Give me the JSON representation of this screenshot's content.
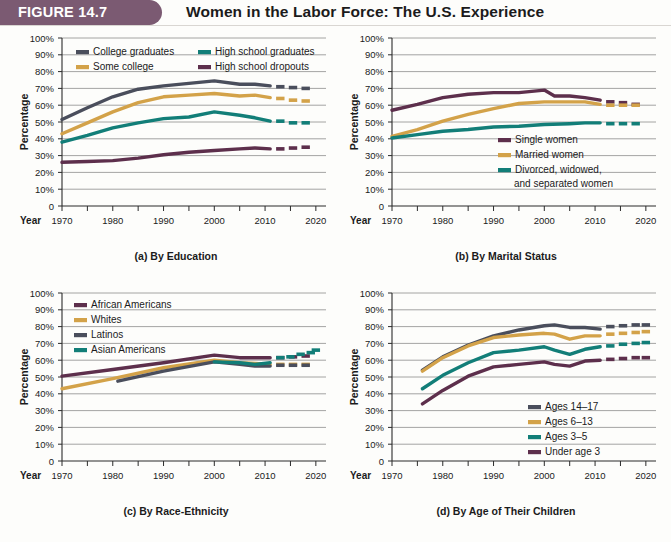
{
  "header": {
    "figure_tag": "FIGURE 14.7",
    "title": "Women in the Labor Force: The U.S. Experience",
    "tab_color": "#7b5a72"
  },
  "colors": {
    "slate": "#4a4e5c",
    "gold": "#d3a249",
    "teal": "#127e78",
    "plum": "#5d2f4c"
  },
  "axes": {
    "y_ticks": [
      "100%",
      "90%",
      "80%",
      "70%",
      "60%",
      "50%",
      "40%",
      "30%",
      "20%",
      "10%",
      "0"
    ],
    "x_ticks": [
      "1970",
      "1980",
      "1990",
      "2000",
      "2010",
      "2020"
    ],
    "x_label": "Year",
    "y_label": "Percentage"
  },
  "chart_data": [
    {
      "type": "line",
      "panel": "a",
      "title": "(a) By Education",
      "xlabel": "Year",
      "ylabel": "Percentage",
      "xlim": [
        1970,
        2022
      ],
      "ylim": [
        0,
        100
      ],
      "grid": true,
      "legend_position": "top-inside",
      "series": [
        {
          "name": "College graduates",
          "color": "#4a4e5c",
          "x": [
            1970,
            1975,
            1980,
            1985,
            1990,
            1995,
            2000,
            2005,
            2008,
            2011
          ],
          "values": [
            51.5,
            58.5,
            65.0,
            69.5,
            71.5,
            73.0,
            74.5,
            72.5,
            72.5,
            71.5
          ],
          "projection_x": [
            2013,
            2015.5,
            2018
          ],
          "projection_values": [
            71.0,
            70.5,
            70.0
          ]
        },
        {
          "name": "Some college",
          "color": "#d3a249",
          "x": [
            1970,
            1975,
            1980,
            1985,
            1990,
            1995,
            2000,
            2005,
            2008,
            2011
          ],
          "values": [
            43.0,
            49.5,
            56.0,
            61.5,
            65.0,
            66.0,
            67.0,
            65.5,
            66.0,
            64.5
          ],
          "projection_x": [
            2013,
            2015.5,
            2018
          ],
          "projection_values": [
            64.0,
            63.0,
            62.5
          ]
        },
        {
          "name": "High school graduates",
          "color": "#127e78",
          "x": [
            1970,
            1975,
            1980,
            1985,
            1990,
            1995,
            2000,
            2005,
            2008,
            2011
          ],
          "values": [
            38.0,
            42.0,
            46.5,
            49.5,
            52.0,
            53.0,
            56.0,
            54.0,
            52.5,
            50.5
          ],
          "projection_x": [
            2013,
            2015.5,
            2018
          ],
          "projection_values": [
            50.5,
            49.5,
            49.5
          ]
        },
        {
          "name": "High school dropouts",
          "color": "#5d2f4c",
          "x": [
            1970,
            1975,
            1980,
            1985,
            1990,
            1995,
            2000,
            2005,
            2008,
            2011
          ],
          "values": [
            26.0,
            26.5,
            27.0,
            28.5,
            30.5,
            32.0,
            33.0,
            34.0,
            34.5,
            34.0
          ],
          "projection_x": [
            2013,
            2015.5,
            2018
          ],
          "projection_values": [
            34.0,
            34.5,
            35.0
          ]
        }
      ]
    },
    {
      "type": "line",
      "panel": "b",
      "title": "(b) By Marital Status",
      "xlabel": "Year",
      "ylabel": "Percentage",
      "xlim": [
        1970,
        2022
      ],
      "ylim": [
        0,
        100
      ],
      "grid": true,
      "legend_position": "middle-right-inside",
      "series": [
        {
          "name": "Single women",
          "color": "#5d2f4c",
          "x": [
            1970,
            1975,
            1980,
            1985,
            1990,
            1995,
            2000,
            2002,
            2005,
            2008,
            2011
          ],
          "values": [
            57.0,
            60.5,
            64.5,
            66.5,
            67.5,
            67.5,
            69.0,
            65.5,
            65.5,
            64.5,
            63.0
          ],
          "projection_x": [
            2013,
            2015.5,
            2018
          ],
          "projection_values": [
            62.0,
            61.5,
            60.5
          ]
        },
        {
          "name": "Married women",
          "color": "#d3a249",
          "x": [
            1970,
            1975,
            1980,
            1985,
            1990,
            1995,
            2000,
            2005,
            2008,
            2011
          ],
          "values": [
            41.5,
            45.5,
            50.5,
            54.5,
            58.0,
            61.0,
            62.0,
            62.0,
            62.0,
            60.5
          ],
          "projection_x": [
            2013,
            2015.5,
            2018
          ],
          "projection_values": [
            60.0,
            60.0,
            60.0
          ]
        },
        {
          "name": "Divorced, widowed, and separated women",
          "color": "#127e78",
          "x": [
            1970,
            1975,
            1980,
            1985,
            1990,
            1995,
            2000,
            2005,
            2008,
            2011
          ],
          "values": [
            40.5,
            42.5,
            44.5,
            45.5,
            47.0,
            47.5,
            48.5,
            49.0,
            49.5,
            49.5
          ],
          "projection_x": [
            2013,
            2015.5,
            2018
          ],
          "projection_values": [
            49.0,
            49.0,
            49.0
          ]
        }
      ]
    },
    {
      "type": "line",
      "panel": "c",
      "title": "(c) By Race-Ethnicity",
      "xlabel": "Year",
      "ylabel": "Percentage",
      "xlim": [
        1970,
        2022
      ],
      "ylim": [
        0,
        100
      ],
      "grid": true,
      "legend_position": "top-left-inside",
      "series": [
        {
          "name": "African Americans",
          "color": "#5d2f4c",
          "x": [
            1970,
            1980,
            1990,
            2000,
            2005,
            2008,
            2011
          ],
          "values": [
            50.5,
            54.5,
            58.5,
            63.0,
            61.5,
            61.5,
            61.5
          ],
          "projection_x": [
            2013,
            2015.5,
            2018
          ],
          "projection_values": [
            61.5,
            62.0,
            62.5
          ]
        },
        {
          "name": "Whites",
          "color": "#d3a249",
          "x": [
            1970,
            1980,
            1990,
            2000,
            2005,
            2008,
            2011
          ],
          "values": [
            43.0,
            49.0,
            55.5,
            60.0,
            58.5,
            58.0,
            57.5
          ],
          "projection_x": [
            2013,
            2015.5,
            2018
          ],
          "projection_values": [
            57.5,
            57.5,
            57.5
          ]
        },
        {
          "name": "Latinos",
          "color": "#4a4e5c",
          "x": [
            1981,
            1990,
            2000,
            2005,
            2008,
            2011
          ],
          "values": [
            47.5,
            53.5,
            59.0,
            57.5,
            56.5,
            56.5
          ],
          "projection_x": [
            2013,
            2015.5,
            2018
          ],
          "projection_values": [
            57.0,
            57.0,
            57.0
          ]
        },
        {
          "name": "Asian Americans",
          "color": "#127e78",
          "x": [
            2000,
            2005,
            2008,
            2011
          ],
          "values": [
            59.0,
            58.5,
            57.5,
            58.5
          ],
          "projection_x": [
            2013,
            2015,
            2017,
            2019,
            2020
          ],
          "projection_values": [
            61.5,
            62.0,
            63.5,
            64.5,
            66.0
          ]
        }
      ]
    },
    {
      "type": "line",
      "panel": "d",
      "title": "(d) By Age of Their Children",
      "xlabel": "Year",
      "ylabel": "Percentage",
      "xlim": [
        1970,
        2022
      ],
      "ylim": [
        0,
        100
      ],
      "grid": true,
      "legend_position": "bottom-right-inside",
      "series": [
        {
          "name": "Ages 14–17",
          "color": "#4a4e5c",
          "x": [
            1976,
            1980,
            1985,
            1990,
            1995,
            2000,
            2002,
            2005,
            2008,
            2011
          ],
          "values": [
            54.0,
            62.0,
            69.0,
            74.5,
            78.0,
            80.5,
            81.0,
            79.5,
            79.5,
            78.5
          ],
          "projection_x": [
            2013,
            2015.5,
            2018,
            2020
          ],
          "projection_values": [
            80.0,
            80.5,
            81.0,
            81.0
          ]
        },
        {
          "name": "Ages 6–13",
          "color": "#d3a249",
          "x": [
            1976,
            1980,
            1985,
            1990,
            1995,
            2000,
            2002,
            2005,
            2008,
            2011
          ],
          "values": [
            53.5,
            61.5,
            68.5,
            73.5,
            75.0,
            76.0,
            75.5,
            72.5,
            74.5,
            74.5
          ],
          "projection_x": [
            2013,
            2015.5,
            2018,
            2020
          ],
          "projection_values": [
            75.5,
            76.0,
            76.5,
            77.0
          ]
        },
        {
          "name": "Ages 3–5",
          "color": "#127e78",
          "x": [
            1976,
            1980,
            1985,
            1990,
            1995,
            2000,
            2002,
            2005,
            2008,
            2011
          ],
          "values": [
            43.0,
            51.0,
            58.5,
            64.5,
            66.0,
            68.0,
            66.0,
            63.5,
            66.5,
            68.0
          ],
          "projection_x": [
            2013,
            2015.5,
            2018,
            2020
          ],
          "projection_values": [
            68.5,
            69.5,
            70.0,
            70.5
          ]
        },
        {
          "name": "Under age 3",
          "color": "#5d2f4c",
          "x": [
            1976,
            1980,
            1985,
            1990,
            1995,
            2000,
            2002,
            2005,
            2008,
            2011
          ],
          "values": [
            34.0,
            42.0,
            50.5,
            56.0,
            57.5,
            59.0,
            57.5,
            56.5,
            59.5,
            60.0
          ],
          "projection_x": [
            2013,
            2015.5,
            2018,
            2020
          ],
          "projection_values": [
            60.5,
            61.0,
            61.5,
            61.5
          ]
        }
      ]
    }
  ]
}
